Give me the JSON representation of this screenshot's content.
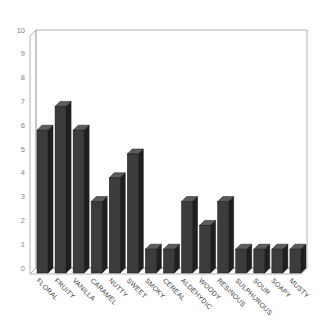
{
  "chart_data": {
    "type": "bar",
    "style": "3d-column",
    "title": "",
    "xlabel": "",
    "ylabel": "",
    "categories": [
      "FLORAL",
      "FRUITY",
      "VANILLA",
      "CARAMEL",
      "NUTTY",
      "SWEET",
      "SMOKY",
      "CEREAL",
      "ALDEHYDIC",
      "WOODY",
      "RESINOUS",
      "SULPHUROUS",
      "SOUR",
      "SOAPY",
      "MUSTY"
    ],
    "values": [
      6,
      7,
      6,
      3,
      4,
      5,
      1,
      1,
      3,
      2,
      3,
      1,
      1,
      1,
      1
    ],
    "ylim": [
      0,
      10
    ],
    "yticks": [
      "0",
      "1",
      "2",
      "3",
      "4",
      "5",
      "6",
      "7",
      "8",
      "9",
      "10"
    ],
    "grid": false,
    "legend": false,
    "colors": {
      "background": "#ffffff",
      "bar_front": "#3c3c3c",
      "bar_side": "#1f1f1f",
      "bar_top": "#5c5c5c",
      "bar_outline": "#141414",
      "wall_line": "#b3b3b3",
      "tick_label": "#858585",
      "category_label": "#3a3a3a"
    }
  }
}
